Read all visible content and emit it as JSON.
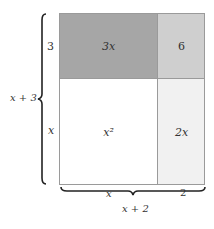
{
  "diagram": {
    "cells": {
      "top_left": {
        "label": "3x",
        "color": "#a6a6a6"
      },
      "top_right": {
        "label": "6",
        "color": "#cfcfcf"
      },
      "bottom_left": {
        "label": "x²",
        "color": "#ffffff"
      },
      "bottom_right": {
        "label": "2x",
        "color": "#f1f1f1"
      }
    },
    "side_labels": {
      "left_top": "3",
      "left_bottom": "x",
      "left_total": "x + 3",
      "bottom_left": "x",
      "bottom_right": "2",
      "bottom_total": "x + 2"
    }
  }
}
